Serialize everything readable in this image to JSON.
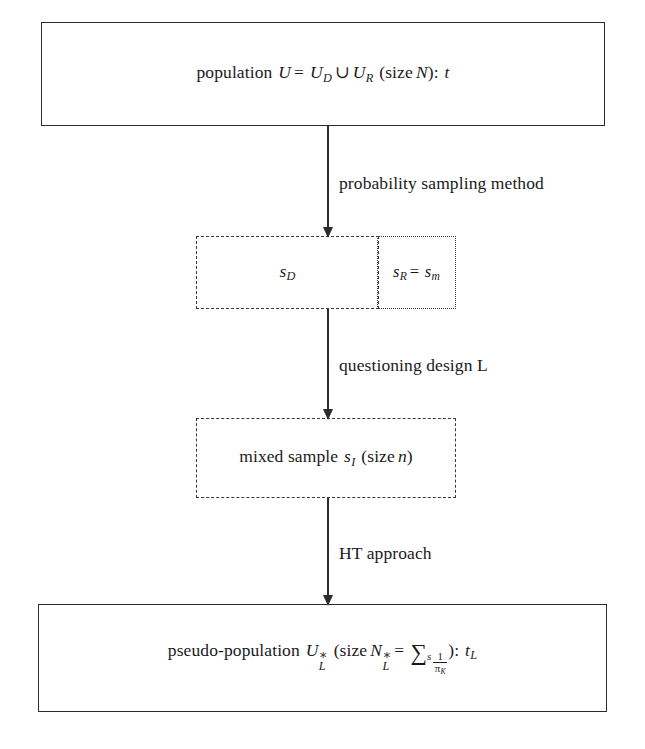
{
  "diagram": {
    "type": "flowchart",
    "background_color": "#ffffff",
    "line_color": "#2b2b2b",
    "nodes": [
      {
        "id": "population",
        "border_style": "solid",
        "text_plain": "population U = U_D ∪ U_R (size N): t",
        "parts": {
          "label": "population",
          "u": "U",
          "eq": "=",
          "u_d": "U",
          "u_d_sub": "D",
          "cup": "∪",
          "u_r": "U",
          "u_r_sub": "R",
          "size_open": "(size",
          "n": "N",
          "size_close": "):",
          "t": "t"
        }
      },
      {
        "id": "sample-d",
        "border_style": "dashed",
        "text_plain": "s_D",
        "parts": {
          "s": "s",
          "sub": "D"
        }
      },
      {
        "id": "sample-r",
        "border_style": "dotted",
        "text_plain": "s_R = s_m",
        "parts": {
          "s1": "s",
          "sub1": "R",
          "eq": "=",
          "s2": "s",
          "sub2": "m"
        }
      },
      {
        "id": "mixed-sample",
        "border_style": "dashed",
        "text_plain": "mixed sample s_I (size n)",
        "parts": {
          "label": "mixed sample",
          "s": "s",
          "sub": "I",
          "size_open": "(size",
          "n": "n",
          "size_close": ")"
        }
      },
      {
        "id": "pseudo-population",
        "border_style": "solid",
        "text_plain": "pseudo-population U*_L (size N*_L = Σ_s 1/π_K): t_L",
        "parts": {
          "label": "pseudo-population",
          "u": "U",
          "u_star": "∗",
          "u_sub": "L",
          "size_open": "(size",
          "n": "N",
          "n_star": "∗",
          "n_sub": "L",
          "eq": "=",
          "sigma": "∑",
          "sigma_sub": "s",
          "frac_num": "1",
          "frac_den": "π",
          "frac_den_sub": "K",
          "size_close": "):",
          "t": "t",
          "t_sub": "L"
        }
      }
    ],
    "edges": [
      {
        "id": "edge-1",
        "from": "population",
        "to": "sample-d",
        "label": "probability sampling method"
      },
      {
        "id": "edge-2",
        "from": "sample-d",
        "to": "mixed-sample",
        "label": "questioning design L"
      },
      {
        "id": "edge-3",
        "from": "mixed-sample",
        "to": "pseudo-population",
        "label": "HT approach"
      }
    ]
  }
}
